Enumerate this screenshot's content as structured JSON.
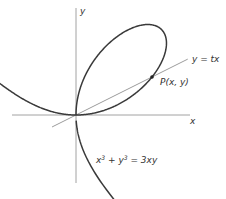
{
  "figure": {
    "type": "diagram",
    "labels": {
      "x_axis": "x",
      "y_axis": "y",
      "line": "y = tx",
      "point": "P(x, y)",
      "equation_html": "x³ + y³ = 3xy"
    },
    "origin_px": [
      76,
      115
    ],
    "scale_px": [
      57,
      57
    ],
    "axes": {
      "x_axis": {
        "from": 12,
        "to": 190
      },
      "y_axis": {
        "from": 8,
        "to": 183
      }
    },
    "line": {
      "slope_t": 0.5,
      "x_from": -0.42,
      "x_to": 1.96
    },
    "point_t": 0.5,
    "curve": {
      "equation": "x^3 + y^3 = 3xy",
      "branches": [
        {
          "t_from": -0.62,
          "t_to": -0.03
        },
        {
          "t_from": 0.0,
          "t_to": 60
        },
        {
          "t_from": -30,
          "t_to": -1.6
        }
      ]
    },
    "colors": {
      "curve": "#3a3a3a",
      "axis": "#8a8a8a",
      "line": "#707070",
      "text": "#333333"
    }
  }
}
